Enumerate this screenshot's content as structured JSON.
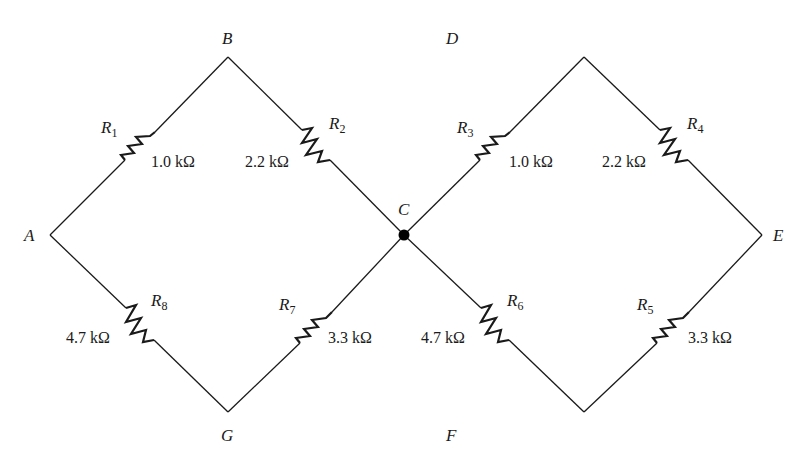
{
  "diagram": {
    "nodes": [
      {
        "id": "A",
        "label": "A"
      },
      {
        "id": "B",
        "label": "B"
      },
      {
        "id": "C",
        "label": "C"
      },
      {
        "id": "D",
        "label": "D"
      },
      {
        "id": "E",
        "label": "E"
      },
      {
        "id": "F",
        "label": "F"
      },
      {
        "id": "G",
        "label": "G"
      }
    ],
    "resistors": [
      {
        "name": "R",
        "sub": "1",
        "value": "1.0 kΩ",
        "between": "A-B"
      },
      {
        "name": "R",
        "sub": "2",
        "value": "2.2 kΩ",
        "between": "B-C"
      },
      {
        "name": "R",
        "sub": "3",
        "value": "1.0 kΩ",
        "between": "C-D"
      },
      {
        "name": "R",
        "sub": "4",
        "value": "2.2 kΩ",
        "between": "D-E"
      },
      {
        "name": "R",
        "sub": "5",
        "value": "3.3 kΩ",
        "between": "E-F"
      },
      {
        "name": "R",
        "sub": "6",
        "value": "4.7 kΩ",
        "between": "F-C"
      },
      {
        "name": "R",
        "sub": "7",
        "value": "3.3 kΩ",
        "between": "C-G"
      },
      {
        "name": "R",
        "sub": "8",
        "value": "4.7 kΩ",
        "between": "G-A"
      }
    ],
    "junction": {
      "node": "C",
      "color": "#000000"
    },
    "line_color": "#1a1a1a"
  }
}
